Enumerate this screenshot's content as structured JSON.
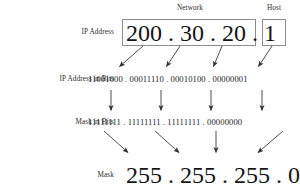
{
  "figure": {
    "title_network": "Network",
    "title_host": "Host",
    "rows": [
      {
        "id": "ip-address",
        "label": "IP Address",
        "octets": [
          "200",
          "30",
          "20",
          "1"
        ],
        "separator": "."
      },
      {
        "id": "ip-address-in-bits",
        "label": "IP Address in Bits",
        "octets": [
          "11001000",
          "00011110",
          "00010100",
          "00000001"
        ],
        "separator": "."
      },
      {
        "id": "mask-in-bits",
        "label": "Mask in Bits",
        "octets": [
          "11111111",
          "11111111",
          "11111111",
          "00000000"
        ],
        "separator": "."
      },
      {
        "id": "mask",
        "label": "Mask",
        "octets": [
          "255",
          "255",
          "255",
          "0"
        ],
        "separator": "."
      }
    ],
    "ip_address_value": "200 . 30 . 20 . 1",
    "ip_bits_value": "11001000 . 00011110 . 00010100 . 00000001",
    "mask_bits_value": "11111111 . 11111111 . 11111111 . 00000000",
    "mask_value": "255 . 255 . 255 . 0",
    "colors": {
      "text": "#1a1a1a",
      "box_border": "#8d8d8d",
      "arrow": "#3a3a3a",
      "background": "#ffffff"
    }
  }
}
